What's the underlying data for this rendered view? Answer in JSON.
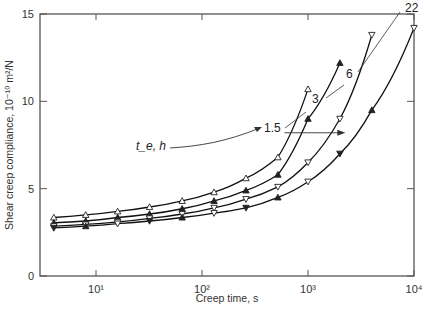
{
  "chart_data": {
    "type": "line",
    "title": "",
    "xlabel": "Creep time, s",
    "ylabel": "Shear creep compliance, 10⁻¹⁰ m²/N",
    "xscale": "log",
    "xlim": [
      3.5,
      10000
    ],
    "ylim": [
      0,
      15
    ],
    "x_ticks": [
      "10¹",
      "10²",
      "10³",
      "10⁴"
    ],
    "y_ticks": [
      "0",
      "5",
      "10",
      "15"
    ],
    "grid": false,
    "legend_annotation": {
      "label": "t_e, h",
      "entries": [
        "1.5",
        "3",
        "6",
        "22"
      ]
    },
    "shift_arrow": {
      "from_time_s": 550,
      "to_time_s": 2300,
      "compliance": 8.2
    },
    "series": [
      {
        "name": "1.5",
        "marker": "open-triangle-up",
        "x": [
          4,
          8,
          16,
          32,
          65,
          130,
          260,
          520,
          1000
        ],
        "y": [
          3.35,
          3.5,
          3.7,
          3.95,
          4.3,
          4.8,
          5.6,
          6.8,
          10.7
        ]
      },
      {
        "name": "3",
        "marker": "filled-triangle-up",
        "x": [
          4,
          8,
          16,
          32,
          65,
          130,
          260,
          520,
          1000,
          2000
        ],
        "y": [
          3.05,
          3.15,
          3.35,
          3.55,
          3.85,
          4.3,
          4.9,
          5.8,
          9.0,
          12.2
        ]
      },
      {
        "name": "6",
        "marker": "open-triangle-down",
        "x": [
          4,
          8,
          16,
          32,
          65,
          130,
          260,
          520,
          1000,
          2000,
          4000
        ],
        "y": [
          2.85,
          2.95,
          3.1,
          3.3,
          3.55,
          3.9,
          4.4,
          5.1,
          6.5,
          9.0,
          13.8
        ]
      },
      {
        "name": "22",
        "marker": "filled-triangle-down / mixed",
        "x": [
          4,
          8,
          16,
          32,
          65,
          130,
          260,
          520,
          1000,
          2000,
          4000,
          10000
        ],
        "y": [
          2.75,
          2.85,
          3.0,
          3.15,
          3.35,
          3.6,
          3.9,
          4.5,
          5.4,
          7.0,
          9.5,
          14.2
        ]
      }
    ]
  }
}
